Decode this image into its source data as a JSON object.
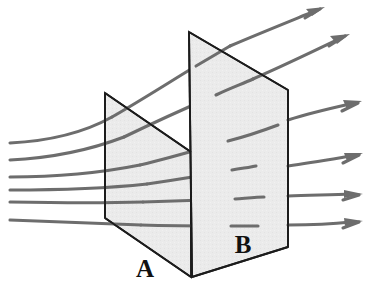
{
  "figure": {
    "background_color": "#ffffff",
    "width": 385,
    "height": 293,
    "plane_fill_color": "#ebebeb",
    "plane_stroke_color": "#1c1c1c",
    "fieldline_color": "#6d6d6d",
    "label_color": "#111111",
    "labels": [
      {
        "text": "A",
        "name": "plane-a-label",
        "x": 145,
        "y": 277
      },
      {
        "text": "B",
        "name": "plane-b-label",
        "x": 243,
        "y": 253
      }
    ],
    "planes": [
      {
        "name": "plane-a",
        "label": "A",
        "points": "105,93 191,152 191,277 105,218"
      },
      {
        "name": "plane-b",
        "label": "B",
        "points": "189,32 288,90 288,247 192,277"
      }
    ],
    "fieldlines": [
      {
        "name": "fieldline-1",
        "path": "M 10,143 C 70,139 120,120 165,92 C 215,61 265,33 312,14",
        "head": {
          "x": 322,
          "y": 10,
          "angle": -21
        }
      },
      {
        "name": "fieldline-2",
        "path": "M 10,160 C 70,157 120,142 168,117 C 220,90 280,61 337,38",
        "head": {
          "x": 347,
          "y": 34,
          "angle": -22
        }
      },
      {
        "name": "fieldline-3",
        "path": "M 10,177 C 75,176 135,168 195,152 C 255,136 305,119 348,106",
        "head": {
          "x": 359,
          "y": 103,
          "angle": -16
        }
      },
      {
        "name": "fieldline-4",
        "path": "M 10,190 C 80,190 150,187 215,180 C 272,174 320,165 354,156",
        "head": {
          "x": 364,
          "y": 153,
          "angle": -14
        }
      },
      {
        "name": "fieldline-5",
        "path": "M 10,202 C 80,203 160,203 235,200 C 290,198 330,196 352,194",
        "head": {
          "x": 363,
          "y": 194,
          "angle": -3
        }
      },
      {
        "name": "fieldline-6",
        "path": "M 10,220 C 80,222 160,224 235,225 C 290,226 330,224 352,222",
        "head": {
          "x": 363,
          "y": 221,
          "angle": -4
        }
      }
    ]
  }
}
